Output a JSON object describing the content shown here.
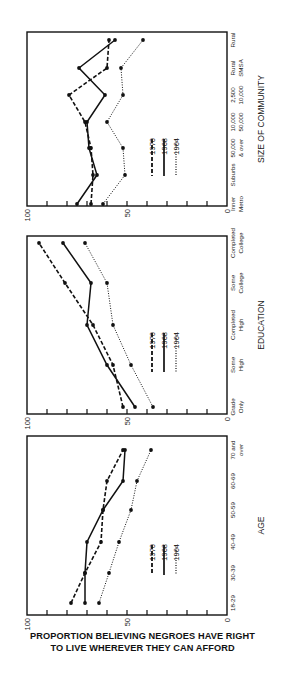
{
  "figure": {
    "title_line1": "PROPORTION BELIEVING NEGROES HAVE RIGHT",
    "title_line2": "TO LIVE WHEREVER THEY CAN AFFORD"
  },
  "chart_data": [
    {
      "type": "line",
      "id": "community",
      "xlabel": "SIZE OF COMMUNITY",
      "ylabel": "PROPORTION BELIEVING NEGROES HAVE RIGHT TO LIVE WHEREVER THEY CAN AFFORD",
      "categories": [
        "Inner Metro",
        "Suburbs",
        "50,000 & over",
        "10,000 50,000",
        "2,500 10,000",
        "Rural SMSA",
        "Rural"
      ],
      "category_lines": [
        [
          "Inner",
          "Metro"
        ],
        [
          "Suburbs",
          ""
        ],
        [
          "50,000",
          "& over"
        ],
        [
          "10,000",
          "50,000"
        ],
        [
          "2,500",
          "10,000"
        ],
        [
          "Rural",
          "SMSA"
        ],
        [
          "Rural",
          ""
        ]
      ],
      "ylim": [
        0,
        100
      ],
      "yticks": [
        0,
        50,
        100
      ],
      "series": [
        {
          "name": "1970",
          "style": "dashed",
          "values": [
            68,
            67,
            68,
            71,
            79,
            60,
            59
          ]
        },
        {
          "name": "1968",
          "style": "solid",
          "values": [
            75,
            65,
            69,
            70,
            61,
            74,
            56
          ]
        },
        {
          "name": "1964",
          "style": "dotted",
          "values": [
            62,
            51,
            52,
            60,
            52,
            53,
            42
          ]
        }
      ],
      "legend": [
        "1970",
        "1968",
        "1964"
      ],
      "grid": false
    },
    {
      "type": "line",
      "id": "education",
      "xlabel": "EDUCATION",
      "ylabel": "PROPORTION BELIEVING NEGROES HAVE RIGHT TO LIVE WHEREVER THEY CAN AFFORD",
      "categories": [
        "Grade Only",
        "Some High",
        "Completed High",
        "Some College",
        "Completed College"
      ],
      "category_lines": [
        [
          "Grade",
          "Only"
        ],
        [
          "Some",
          "High"
        ],
        [
          "Completed",
          "High"
        ],
        [
          "Some",
          "College"
        ],
        [
          "Completed",
          "College"
        ]
      ],
      "ylim": [
        0,
        100
      ],
      "yticks": [
        0,
        50,
        100
      ],
      "series": [
        {
          "name": "1970",
          "style": "dashed",
          "values": [
            52,
            57,
            67,
            81,
            94
          ]
        },
        {
          "name": "1968",
          "style": "solid",
          "values": [
            46,
            60,
            70,
            68,
            82
          ]
        },
        {
          "name": "1964",
          "style": "dotted",
          "values": [
            37,
            48,
            57,
            60,
            71
          ]
        }
      ],
      "legend": [
        "1970",
        "1968",
        "1964"
      ],
      "grid": false
    },
    {
      "type": "line",
      "id": "age",
      "xlabel": "AGE",
      "ylabel": "PROPORTION BELIEVING NEGROES HAVE RIGHT TO LIVE WHEREVER THEY CAN AFFORD",
      "categories": [
        "18-29",
        "30-39",
        "40-49",
        "50-59",
        "60-69",
        "70 and over"
      ],
      "category_lines": [
        [
          "18-29",
          ""
        ],
        [
          "30-39",
          ""
        ],
        [
          "40-49",
          ""
        ],
        [
          "50-59",
          ""
        ],
        [
          "60-69",
          ""
        ],
        [
          "70 and",
          "over"
        ]
      ],
      "ylim": [
        0,
        100
      ],
      "yticks": [
        0,
        50,
        100
      ],
      "series": [
        {
          "name": "1970",
          "style": "dashed",
          "values": [
            78,
            71,
            63,
            62,
            60,
            52
          ]
        },
        {
          "name": "1968",
          "style": "solid",
          "values": [
            71,
            71,
            70,
            62,
            52,
            51
          ]
        },
        {
          "name": "1964",
          "style": "dotted",
          "values": [
            64,
            59,
            54,
            48,
            45,
            38
          ]
        }
      ],
      "legend": [
        "1970",
        "1968",
        "1964"
      ],
      "grid": false
    }
  ],
  "layout_panels": [
    {
      "frame": {
        "left": 27,
        "top": 32,
        "right": 227,
        "bottom": 206
      },
      "cat_y": [
        204,
        175,
        148,
        122,
        95,
        68,
        40
      ],
      "legend": {
        "x": 152,
        "text_top": 122,
        "line_top": 139,
        "line_bottom": 176
      },
      "xlabel_x": 264
    },
    {
      "frame": {
        "left": 27,
        "top": 236,
        "right": 227,
        "bottom": 414
      },
      "cat_y": [
        407,
        365,
        325,
        283,
        243
      ],
      "legend": {
        "x": 152,
        "text_top": 316,
        "line_top": 333,
        "line_bottom": 372
      },
      "xlabel_x": 264
    },
    {
      "frame": {
        "left": 27,
        "top": 436,
        "right": 227,
        "bottom": 615
      },
      "cat_y": [
        603,
        573,
        542,
        510,
        481,
        450
      ],
      "legend": {
        "x": 152,
        "text_top": 528,
        "line_top": 545,
        "line_bottom": 575
      },
      "xlabel_x": 264
    }
  ]
}
